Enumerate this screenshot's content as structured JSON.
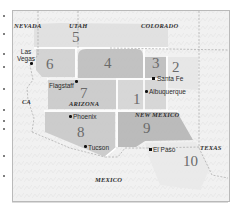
{
  "map": {
    "states": [
      {
        "id": "nevada",
        "label": "NEVADA",
        "x": 14,
        "y": 23
      },
      {
        "id": "utah",
        "label": "UTAH",
        "x": 69,
        "y": 23
      },
      {
        "id": "colorado",
        "label": "COLORADO",
        "x": 141,
        "y": 23
      },
      {
        "id": "ca",
        "label": "CA",
        "x": 22,
        "y": 99
      },
      {
        "id": "arizona",
        "label": "ARIZONA",
        "x": 69,
        "y": 101
      },
      {
        "id": "new-mexico",
        "label": "NEW MEXICO",
        "x": 135,
        "y": 112
      },
      {
        "id": "texas",
        "label": "TEXAS",
        "x": 200,
        "y": 145
      },
      {
        "id": "mexico",
        "label": "MEXICO",
        "x": 95,
        "y": 177
      }
    ],
    "regions": [
      {
        "id": "1",
        "label": "1",
        "x": 133,
        "y": 92
      },
      {
        "id": "2",
        "label": "2",
        "x": 172,
        "y": 60
      },
      {
        "id": "3",
        "label": "3",
        "x": 153,
        "y": 55
      },
      {
        "id": "4",
        "label": "4",
        "x": 104,
        "y": 56
      },
      {
        "id": "5",
        "label": "5",
        "x": 72,
        "y": 30
      },
      {
        "id": "6",
        "label": "6",
        "x": 46,
        "y": 56
      },
      {
        "id": "7",
        "label": "7",
        "x": 80,
        "y": 86
      },
      {
        "id": "8",
        "label": "8",
        "x": 77,
        "y": 125
      },
      {
        "id": "9",
        "label": "9",
        "x": 143,
        "y": 121
      },
      {
        "id": "10",
        "label": "10",
        "x": 183,
        "y": 154
      }
    ],
    "cities": [
      {
        "id": "las-vegas",
        "label": "Las\nVegas",
        "label_x": 17,
        "label_y": 48,
        "dot_x": 31,
        "dot_y": 63,
        "square": false
      },
      {
        "id": "flagstaff",
        "label": "Flagstaff",
        "label_x": 49,
        "label_y": 84,
        "dot_x": 76,
        "dot_y": 81,
        "square": false
      },
      {
        "id": "santa-fe",
        "label": "Santa Fe",
        "label_x": 157,
        "label_y": 76,
        "dot_x": 153,
        "dot_y": 78,
        "square": true
      },
      {
        "id": "albuquerque",
        "label": "Albuquerque",
        "label_x": 149,
        "label_y": 89,
        "dot_x": 146,
        "dot_y": 91,
        "square": false
      },
      {
        "id": "phoenix",
        "label": "Phoenix",
        "label_x": 73,
        "label_y": 114,
        "dot_x": 70,
        "dot_y": 116,
        "square": false
      },
      {
        "id": "tucson",
        "label": "Tucson",
        "label_x": 88,
        "label_y": 145,
        "dot_x": 85,
        "dot_y": 146,
        "square": false
      },
      {
        "id": "el-paso",
        "label": "El Paso",
        "label_x": 153,
        "label_y": 147,
        "dot_x": 150,
        "dot_y": 149,
        "square": true
      }
    ],
    "colors": {
      "background": "#f1f1f1",
      "region_light": "#d9d9d9",
      "region_mid": "#c6c6c6",
      "region_dark": "#b3b3b3",
      "region_border": "#ffffff",
      "frame_border": "#b9b9b9"
    }
  }
}
